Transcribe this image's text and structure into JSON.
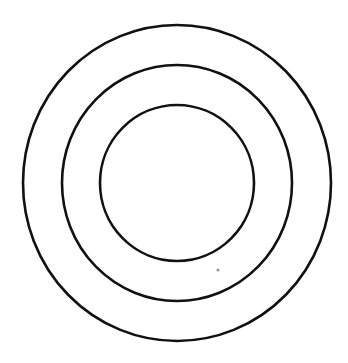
{
  "diagram": {
    "type": "concentric-circles",
    "background": "#ffffff",
    "stroke_color": "#111111",
    "stroke_width": 2.6,
    "center": {
      "x": 177,
      "y": 183
    },
    "rings": [
      {
        "name": "outer-ring",
        "rx": 154,
        "ry": 158
      },
      {
        "name": "middle-ring",
        "rx": 115,
        "ry": 118
      },
      {
        "name": "inner-ring",
        "rx": 77,
        "ry": 78
      }
    ],
    "artifacts": [
      {
        "name": "speck",
        "x": 218,
        "y": 270,
        "r": 1.6,
        "color": "#9a9a9a"
      }
    ]
  }
}
